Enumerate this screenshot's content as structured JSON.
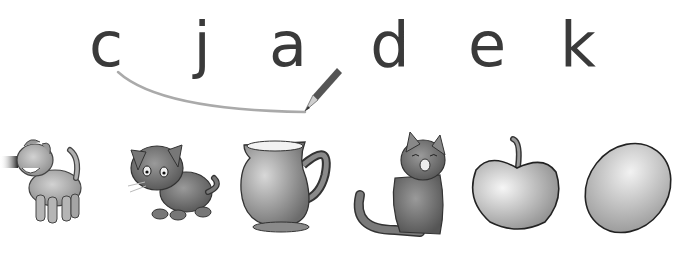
{
  "worksheet": {
    "letters": [
      {
        "char": "c",
        "x": 106
      },
      {
        "char": "j",
        "x": 202
      },
      {
        "char": "a",
        "x": 288
      },
      {
        "char": "d",
        "x": 390
      },
      {
        "char": "e",
        "x": 487
      },
      {
        "char": "k",
        "x": 578
      }
    ],
    "connecting_line": {
      "from": "c",
      "to": "a",
      "color": "#a8a8a8"
    },
    "pictures": [
      {
        "name": "dog",
        "label": "dog"
      },
      {
        "name": "kitten",
        "label": "kitten"
      },
      {
        "name": "jug",
        "label": "jug"
      },
      {
        "name": "cat",
        "label": "cat"
      },
      {
        "name": "apple",
        "label": "apple"
      },
      {
        "name": "egg",
        "label": "egg"
      }
    ]
  }
}
